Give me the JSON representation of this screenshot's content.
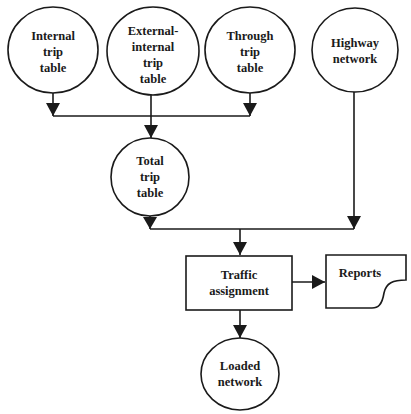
{
  "diagram": {
    "nodes": {
      "internal": {
        "shape": "circle",
        "lines": [
          "Internal",
          "trip",
          "table"
        ]
      },
      "external": {
        "shape": "circle",
        "lines": [
          "External-",
          "internal",
          "trip",
          "table"
        ]
      },
      "through": {
        "shape": "circle",
        "lines": [
          "Through",
          "trip",
          "table"
        ]
      },
      "highway": {
        "shape": "circle",
        "lines": [
          "Highway",
          "network"
        ]
      },
      "total": {
        "shape": "circle",
        "lines": [
          "Total",
          "trip",
          "table"
        ]
      },
      "traffic": {
        "shape": "rectangle",
        "lines": [
          "Traffic",
          "assignment"
        ]
      },
      "reports": {
        "shape": "document",
        "lines": [
          "Reports"
        ]
      },
      "loaded": {
        "shape": "circle",
        "lines": [
          "Loaded",
          "network"
        ]
      }
    },
    "edges": [
      {
        "from": "internal",
        "to": "total"
      },
      {
        "from": "external",
        "to": "total"
      },
      {
        "from": "through",
        "to": "total"
      },
      {
        "from": "total",
        "to": "traffic"
      },
      {
        "from": "highway",
        "to": "traffic"
      },
      {
        "from": "traffic",
        "to": "reports"
      },
      {
        "from": "traffic",
        "to": "loaded"
      }
    ],
    "colors": {
      "stroke": "#1a1a1a",
      "background": "#ffffff"
    }
  }
}
